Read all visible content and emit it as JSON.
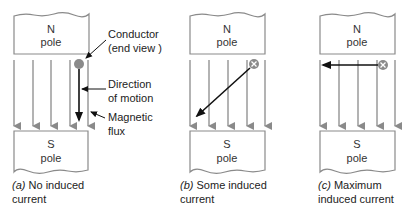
{
  "colors": {
    "pole_outline": "#8a8a8a",
    "flux": "#8a8a8a",
    "conductor_fill": "#8a8a8a",
    "motion": "#111111",
    "text": "#222222"
  },
  "panels": [
    {
      "id": "a",
      "north_label_1": "N",
      "north_label_2": "pole",
      "south_label_1": "S",
      "south_label_2": "pole",
      "conductor_symbol": "dot",
      "motion_direction": "parallel-to-flux (downward)",
      "caption_letter": "(a)",
      "caption_line1": " No induced",
      "caption_line2": "current"
    },
    {
      "id": "b",
      "north_label_1": "N",
      "north_label_2": "pole",
      "south_label_1": "S",
      "south_label_2": "pole",
      "conductor_symbol": "cross",
      "motion_direction": "diagonal (down-left)",
      "caption_letter": "(b)",
      "caption_line1": " Some induced",
      "caption_line2": "current"
    },
    {
      "id": "c",
      "north_label_1": "N",
      "north_label_2": "pole",
      "south_label_1": "S",
      "south_label_2": "pole",
      "conductor_symbol": "cross",
      "motion_direction": "perpendicular-to-flux (left)",
      "caption_letter": "(c)",
      "caption_line1": " Maximum",
      "caption_line2": "induced current"
    }
  ],
  "annotations": {
    "conductor_1": "Conductor",
    "conductor_2": "(end view )",
    "motion_1": "Direction",
    "motion_2": "of motion",
    "flux_1": "Magnetic",
    "flux_2": "flux"
  }
}
